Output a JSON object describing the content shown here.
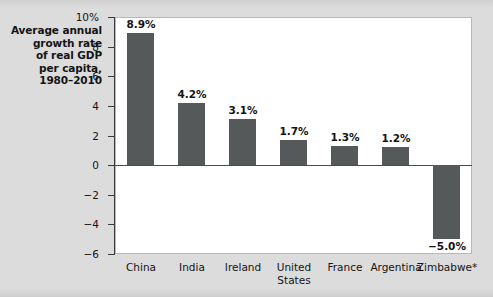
{
  "figure": {
    "background_color": "#dcdcdc",
    "plot_background_color": "#ffffff",
    "bar_color": "#55595a",
    "axis_color": "#3a3a3a"
  },
  "title": {
    "lines": [
      "Average annual",
      "growth rate",
      "of real GDP",
      "per capita,",
      "1980–2010"
    ]
  },
  "chart_data": {
    "type": "bar",
    "title": "Average annual growth rate of real GDP per capita, 1980–2010",
    "xlabel": "",
    "ylabel": "",
    "ylim": [
      -6,
      10
    ],
    "grid": false,
    "legend": false,
    "categories": [
      "China",
      "India",
      "Ireland",
      "United States",
      "France",
      "Argentina",
      "Zimbabwe*"
    ],
    "category_lines": [
      [
        "China"
      ],
      [
        "India"
      ],
      [
        "Ireland"
      ],
      [
        "United",
        "States"
      ],
      [
        "France"
      ],
      [
        "Argentina"
      ],
      [
        "Zimbabwe*"
      ]
    ],
    "values": [
      8.9,
      4.2,
      3.1,
      1.7,
      1.3,
      1.2,
      -5.0
    ],
    "data_labels": [
      "8.9%",
      "4.2%",
      "3.1%",
      "1.7%",
      "1.3%",
      "1.2%",
      "−5.0%"
    ],
    "yticks": [
      10,
      8,
      6,
      4,
      2,
      0,
      -2,
      -4,
      -6
    ],
    "ytick_labels": [
      "10%",
      "8",
      "6",
      "4",
      "2",
      "0",
      "−2",
      "−4",
      "−6"
    ]
  }
}
